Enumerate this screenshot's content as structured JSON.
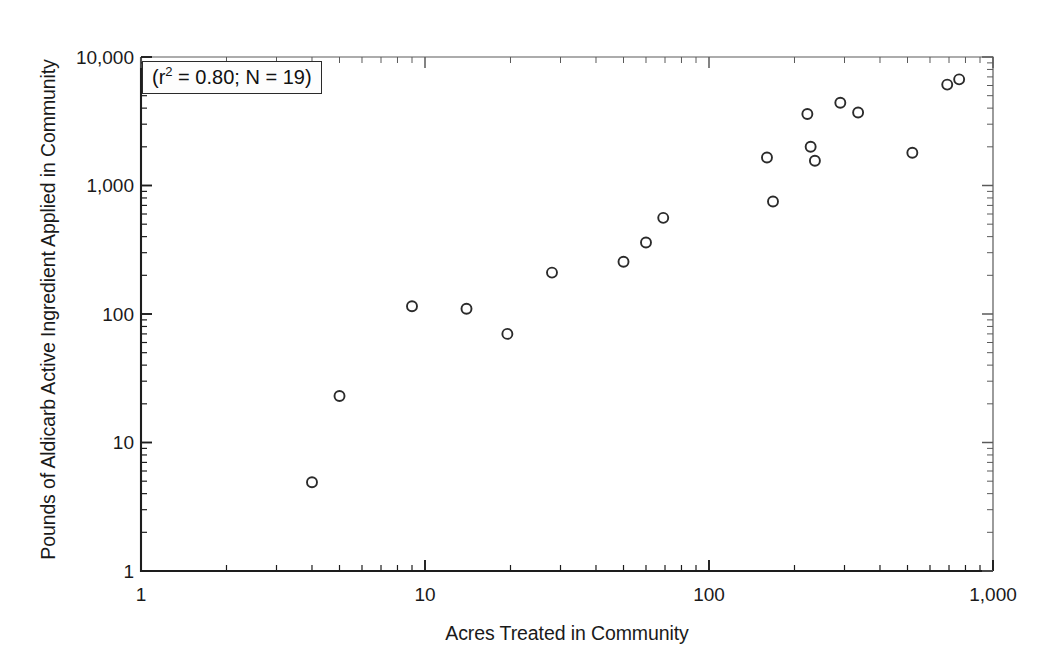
{
  "chart_data": {
    "type": "scatter",
    "title": "",
    "xlabel": "Acres Treated in Community",
    "ylabel": "Pounds of Aldicarb Active Ingredient Applied in Community",
    "xscale": "log",
    "yscale": "log",
    "xlim": [
      1,
      1000
    ],
    "ylim": [
      1,
      10000
    ],
    "grid": false,
    "legend": "none",
    "xtick_labels": [
      "1",
      "10",
      "100",
      "1,000"
    ],
    "xtick_values": [
      1,
      10,
      100,
      1000
    ],
    "ytick_labels": [
      "1",
      "10",
      "100",
      "1,000",
      "10,000"
    ],
    "ytick_values": [
      1,
      10,
      100,
      1000,
      10000
    ],
    "minor_ticks": true,
    "marker": "open-circle",
    "marker_color": "#2b2b2b",
    "annotations": [
      {
        "name": "r-squared-box",
        "text": "(r 2 = 0.80; N = 19)",
        "r_squared": 0.8,
        "n": 19,
        "prefix": "(r",
        "superscript": "2",
        "suffix": " = 0.80; N = 19)"
      }
    ],
    "n_points": 19,
    "x": [
      4,
      5,
      9,
      14,
      19.5,
      28,
      50,
      60,
      69,
      160,
      168,
      222,
      228,
      236,
      290,
      335,
      520,
      690,
      760
    ],
    "y": [
      4.9,
      23,
      115,
      110,
      70,
      210,
      255,
      360,
      560,
      1650,
      750,
      3600,
      2000,
      1560,
      4400,
      3700,
      1800,
      6100,
      6700
    ],
    "points": [
      {
        "x": 4,
        "y": 4.9
      },
      {
        "x": 5,
        "y": 23
      },
      {
        "x": 9,
        "y": 115
      },
      {
        "x": 14,
        "y": 110
      },
      {
        "x": 19.5,
        "y": 70
      },
      {
        "x": 28,
        "y": 210
      },
      {
        "x": 50,
        "y": 255
      },
      {
        "x": 60,
        "y": 360
      },
      {
        "x": 69,
        "y": 560
      },
      {
        "x": 160,
        "y": 1650
      },
      {
        "x": 168,
        "y": 750
      },
      {
        "x": 222,
        "y": 3600
      },
      {
        "x": 228,
        "y": 2000
      },
      {
        "x": 236,
        "y": 1560
      },
      {
        "x": 290,
        "y": 4400
      },
      {
        "x": 335,
        "y": 3700
      },
      {
        "x": 520,
        "y": 1800
      },
      {
        "x": 690,
        "y": 6100
      },
      {
        "x": 760,
        "y": 6700
      }
    ]
  }
}
